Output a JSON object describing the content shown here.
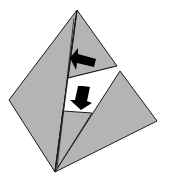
{
  "diagram": {
    "title": "",
    "colors": {
      "background": "#ffffff",
      "face_fill": "#b4b4b4",
      "edge": "#1a1a1a",
      "arrow": "#000000",
      "window": "#ffffff"
    },
    "vertices": {
      "top": [
        77,
        10
      ],
      "left": [
        9,
        100
      ],
      "bottom": [
        55,
        172
      ],
      "right": [
        157,
        121
      ],
      "upper_flap_corner": [
        117,
        66
      ],
      "lower_piece_top": [
        120,
        71
      ]
    },
    "arrows": [
      {
        "id": "arrow-left",
        "direction": "left",
        "position": [
          82,
          59
        ]
      },
      {
        "id": "arrow-down",
        "direction": "down",
        "position": [
          80,
          96
        ]
      }
    ]
  }
}
